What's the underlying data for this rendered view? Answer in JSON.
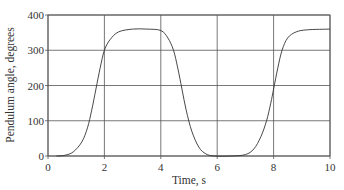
{
  "chart_data": {
    "type": "line",
    "title": "",
    "xlabel": "Time, s",
    "ylabel": "Pendulum angle, degrees",
    "xlim": [
      0,
      10
    ],
    "ylim": [
      0,
      400
    ],
    "xticks": [
      0,
      2,
      4,
      6,
      8,
      10
    ],
    "yticks": [
      0,
      100,
      200,
      300,
      400
    ],
    "xtick_labels": [
      "0",
      "2",
      "4",
      "6",
      "8",
      "10"
    ],
    "ytick_labels": [
      "0",
      "100",
      "200",
      "300",
      "400"
    ],
    "grid": true,
    "legend": null,
    "series": [
      {
        "name": "Pendulum angle",
        "color": "#333333",
        "x": [
          0.3,
          0.6,
          0.9,
          1.2,
          1.4,
          1.55,
          1.7,
          1.85,
          2.0,
          2.2,
          2.5,
          3.0,
          3.5,
          4.0,
          4.25,
          4.45,
          4.6,
          4.75,
          4.9,
          5.1,
          5.35,
          5.6,
          5.9,
          6.5,
          7.0,
          7.3,
          7.55,
          7.75,
          7.9,
          8.0,
          8.15,
          8.3,
          8.5,
          8.8,
          9.2,
          10.0
        ],
        "y": [
          0,
          2,
          12,
          40,
          80,
          130,
          190,
          250,
          300,
          330,
          352,
          360,
          360,
          356,
          335,
          300,
          250,
          190,
          130,
          70,
          25,
          6,
          0,
          0,
          4,
          20,
          55,
          100,
          150,
          190,
          250,
          300,
          335,
          352,
          358,
          360
        ]
      }
    ]
  },
  "colors": {
    "background": "#ffffff",
    "grid": "#555555",
    "line": "#333333",
    "text": "#333333"
  }
}
